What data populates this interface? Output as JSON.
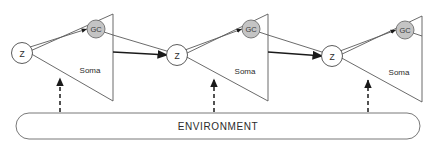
{
  "diagram": {
    "environment": {
      "label": "ENVIRONMENT"
    },
    "units": [
      {
        "id": "unit-1",
        "soma_label": "Soma",
        "z_label": "Z",
        "gc_label": "GC"
      },
      {
        "id": "unit-2",
        "soma_label": "Soma",
        "z_label": "Z",
        "gc_label": "GC"
      },
      {
        "id": "unit-3",
        "soma_label": "Soma",
        "z_label": "Z",
        "gc_label": "GC"
      }
    ],
    "colors": {
      "gc_fill": "#c4c4c4",
      "gc_stroke": "#6d6d6d",
      "node_fill": "#ffffff",
      "node_stroke": "#4a4a4a",
      "outline": "#5a5a5a",
      "arrow": "#1a1a1a",
      "text": "#2b2b2b",
      "background": "#ffffff"
    }
  }
}
